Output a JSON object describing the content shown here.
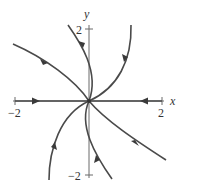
{
  "diagram": {
    "type": "phase-portrait",
    "axes": {
      "x_label": "x",
      "y_label": "y",
      "x_ticks": [
        {
          "value": -2,
          "label": "−2"
        },
        {
          "value": 2,
          "label": "2"
        }
      ],
      "y_ticks": [
        {
          "value": 2,
          "label": "2"
        },
        {
          "value": -2,
          "label": "−2"
        }
      ],
      "xlim": [
        -2,
        2
      ],
      "ylim": [
        -2,
        2
      ]
    },
    "equilibrium": {
      "x": 0,
      "y": 0,
      "type": "stable-node"
    },
    "trajectories": [
      {
        "name": "left-axis",
        "direction": "toward-origin"
      },
      {
        "name": "right-axis",
        "direction": "toward-origin"
      },
      {
        "name": "upper-left",
        "direction": "toward-origin"
      },
      {
        "name": "lower-right",
        "direction": "toward-origin"
      },
      {
        "name": "upper-near-vertical",
        "direction": "toward-origin"
      },
      {
        "name": "upper-right-curve",
        "direction": "toward-origin"
      },
      {
        "name": "lower-left-curve",
        "direction": "toward-origin"
      },
      {
        "name": "lower-near-vertical",
        "direction": "toward-origin"
      }
    ],
    "colors": {
      "curve": "#4a4a4a",
      "axis": "#6a6a6a"
    }
  }
}
